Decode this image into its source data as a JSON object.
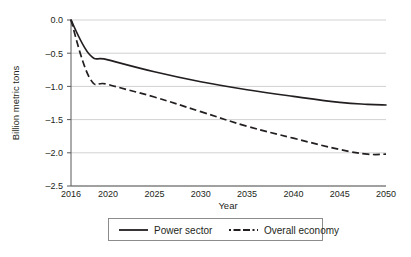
{
  "chart_data": {
    "type": "line",
    "title": "",
    "subtitle": "",
    "xlabel": "Year",
    "ylabel": "Billion metric tons",
    "xlim": [
      2016,
      2050
    ],
    "ylim": [
      -2.5,
      0.0
    ],
    "grid": true,
    "legend_position": "bottom",
    "x_ticks": [
      "2016",
      "2020",
      "2025",
      "2030",
      "2035",
      "2040",
      "2045",
      "2050"
    ],
    "x_tick_values": [
      2016,
      2020,
      2025,
      2030,
      2035,
      2040,
      2045,
      2050
    ],
    "y_ticks": [
      "0.0",
      "-0.5",
      "-1.0",
      "-1.5",
      "-2.0",
      "-2.5"
    ],
    "y_tick_values": [
      0.0,
      -0.5,
      -1.0,
      -1.5,
      -2.0,
      -2.5
    ],
    "x": [
      2016,
      2018,
      2020,
      2025,
      2030,
      2035,
      2040,
      2045,
      2048,
      2050
    ],
    "series": [
      {
        "name": "Power sector",
        "style": "solid",
        "color": "#231f20",
        "values": [
          0.0,
          -0.52,
          -0.6,
          -0.78,
          -0.93,
          -1.05,
          -1.15,
          -1.24,
          -1.27,
          -1.28
        ]
      },
      {
        "name": "Overall economy",
        "style": "dashed",
        "color": "#231f20",
        "values": [
          0.0,
          -0.87,
          -0.97,
          -1.16,
          -1.38,
          -1.6,
          -1.78,
          -1.95,
          -2.02,
          -2.02
        ]
      }
    ]
  },
  "axes": {
    "y_title": "Billion metric tons",
    "x_title": "Year",
    "y_tick_labels": [
      "0.0",
      "–0.5",
      "–1.0",
      "–1.5",
      "–2.0",
      "–2.5"
    ],
    "x_tick_labels": [
      "2016",
      "2020",
      "2025",
      "2030",
      "2035",
      "2040",
      "2045",
      "2050"
    ]
  },
  "legend": {
    "entries": [
      {
        "label": "Power sector",
        "style": "solid"
      },
      {
        "label": "Overall economy",
        "style": "dashed"
      }
    ]
  }
}
